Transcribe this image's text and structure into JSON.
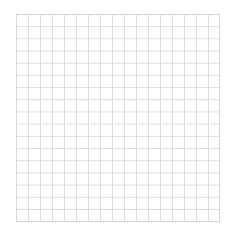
{
  "grid": {
    "columns": 17,
    "rows": 17,
    "line_color": "#dcdcdc",
    "background_color": "#ffffff"
  }
}
